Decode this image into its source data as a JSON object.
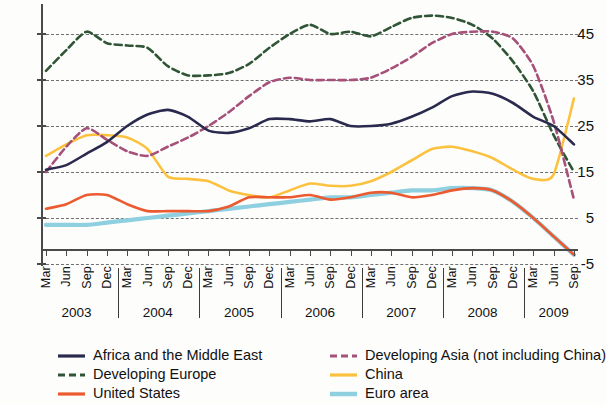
{
  "chart_data": {
    "type": "line",
    "title": "",
    "xlabel": "",
    "ylabel": "",
    "ylim": [
      -5,
      50
    ],
    "yticks": [
      -5,
      5,
      15,
      25,
      35,
      45
    ],
    "grid": true,
    "legend_position": "bottom",
    "years": [
      "2003",
      "2004",
      "2005",
      "2006",
      "2007",
      "2008",
      "2009"
    ],
    "quarter_labels": [
      "Mar",
      "Jun",
      "Sep",
      "Dec"
    ],
    "x": [
      "2003-Mar",
      "2003-Jun",
      "2003-Sep",
      "2003-Dec",
      "2004-Mar",
      "2004-Jun",
      "2004-Sep",
      "2004-Dec",
      "2005-Mar",
      "2005-Jun",
      "2005-Sep",
      "2005-Dec",
      "2006-Mar",
      "2006-Jun",
      "2006-Sep",
      "2006-Dec",
      "2007-Mar",
      "2007-Jun",
      "2007-Sep",
      "2007-Dec",
      "2008-Mar",
      "2008-Jun",
      "2008-Sep",
      "2008-Dec",
      "2009-Mar",
      "2009-Jun",
      "2009-Sep"
    ],
    "series": [
      {
        "name": "Africa and the Middle East",
        "color": "#2a2a4e",
        "style": "solid",
        "values": [
          15.5,
          16.5,
          19.0,
          21.5,
          25.0,
          27.5,
          28.5,
          27.0,
          24.0,
          23.5,
          24.5,
          26.5,
          26.5,
          26.0,
          26.5,
          25.0,
          25.0,
          25.5,
          27.0,
          29.0,
          31.5,
          32.5,
          32.0,
          30.0,
          27.0,
          25.0,
          21.0
        ]
      },
      {
        "name": "Developing Europe",
        "color": "#2f5536",
        "style": "dashed",
        "values": [
          37.0,
          41.5,
          45.5,
          43.0,
          42.5,
          42.0,
          38.0,
          36.0,
          36.0,
          36.5,
          38.5,
          42.0,
          45.0,
          47.0,
          45.0,
          45.5,
          44.5,
          46.5,
          48.5,
          49.0,
          48.5,
          47.0,
          44.0,
          39.0,
          32.5,
          23.0,
          15.0
        ]
      },
      {
        "name": "United States",
        "color": "#ec5a30",
        "style": "solid",
        "values": [
          7.0,
          8.0,
          10.0,
          10.0,
          8.0,
          6.5,
          6.5,
          6.5,
          6.5,
          7.5,
          9.5,
          9.5,
          9.5,
          10.0,
          9.0,
          9.5,
          10.5,
          10.5,
          9.5,
          10.0,
          11.0,
          11.5,
          11.0,
          8.5,
          5.0,
          1.0,
          -3.0
        ]
      },
      {
        "name": "Developing Asia (not including China)",
        "color": "#a65179",
        "style": "dashed",
        "values": [
          15.0,
          20.5,
          24.5,
          22.0,
          19.5,
          18.5,
          20.5,
          22.5,
          25.0,
          28.0,
          31.5,
          34.5,
          35.5,
          35.0,
          35.0,
          35.0,
          35.5,
          37.5,
          40.0,
          43.0,
          45.0,
          45.5,
          45.5,
          44.0,
          38.0,
          26.0,
          9.0
        ]
      },
      {
        "name": "China",
        "color": "#fcc23f",
        "style": "solid",
        "values": [
          18.5,
          21.0,
          23.0,
          23.0,
          22.5,
          20.0,
          14.0,
          13.5,
          13.0,
          11.0,
          10.0,
          9.5,
          11.0,
          12.5,
          12.0,
          12.0,
          13.0,
          15.0,
          17.5,
          20.0,
          20.5,
          19.5,
          18.0,
          15.5,
          13.5,
          14.5,
          31.0
        ]
      },
      {
        "name": "Euro area",
        "color": "#8ecfe0",
        "style": "solid",
        "values": [
          3.5,
          3.5,
          3.5,
          4.0,
          4.5,
          5.0,
          5.5,
          6.0,
          6.5,
          7.0,
          7.5,
          8.0,
          8.5,
          9.0,
          9.5,
          9.5,
          10.0,
          10.5,
          11.0,
          11.0,
          11.5,
          11.5,
          11.0,
          8.5,
          5.0,
          1.0,
          -3.0
        ]
      }
    ]
  },
  "axis": {
    "ytick_labels": [
      "45",
      "35",
      "25",
      "15",
      "5",
      "-5"
    ]
  },
  "legend": {
    "items": [
      {
        "label": "Africa and the Middle East",
        "color": "#2a2a4e",
        "style": "solid"
      },
      {
        "label": "Developing Europe",
        "color": "#2f5536",
        "style": "dashed"
      },
      {
        "label": "United States",
        "color": "#ec5a30",
        "style": "solid"
      },
      {
        "label": "Developing Asia (not including China)",
        "color": "#a65179",
        "style": "dashed"
      },
      {
        "label": "China",
        "color": "#fcc23f",
        "style": "solid"
      },
      {
        "label": "Euro area",
        "color": "#8ecfe0",
        "style": "solid"
      }
    ]
  }
}
